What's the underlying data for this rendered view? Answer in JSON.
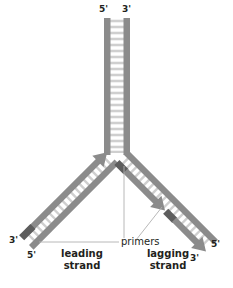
{
  "figure": {
    "background_color": "#ffffff",
    "backbone_color": "#8b8b8b",
    "backbone_dark_color": "#6e6e6e",
    "primer_color": "#5a5a5a",
    "rung_color": "#d9d9d9",
    "leader_line_color": "#aaaaaa",
    "text_color": "#231f20"
  },
  "end_labels": {
    "parent_top_left": "5'",
    "parent_top_right": "3'",
    "leading_template_end": "3'",
    "leading_new_end": "5'",
    "lagging_template_end": "5'",
    "lagging_new_end": "3'"
  },
  "captions": {
    "leading_strand": "leading\nstrand",
    "lagging_strand": "lagging\nstrand",
    "primers": "primers"
  },
  "annotations": {
    "primer_count_leading": 1,
    "primer_count_lagging": 2,
    "okazaki_fragments": 2
  }
}
